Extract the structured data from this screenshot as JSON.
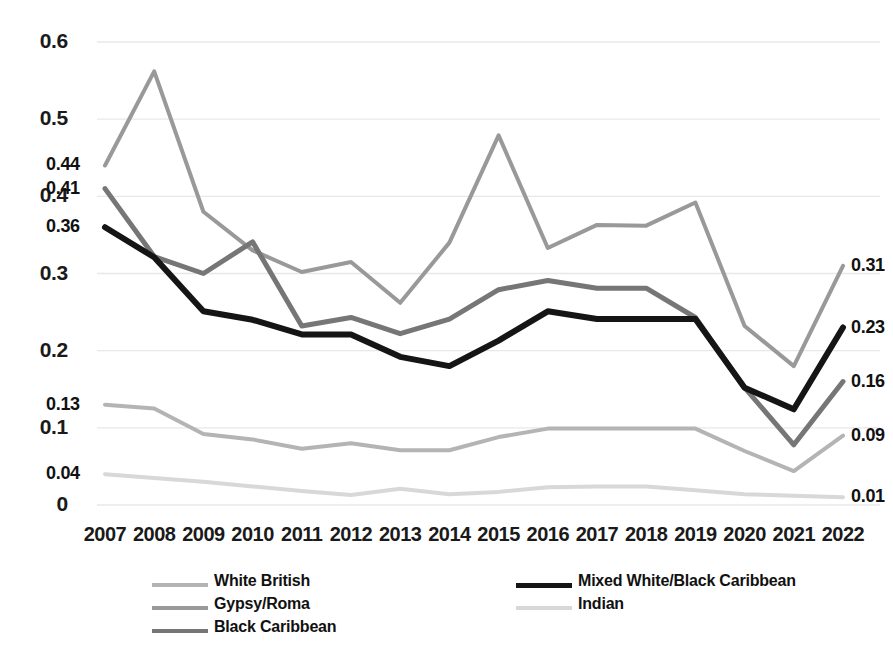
{
  "chart_data": {
    "type": "line",
    "title": "",
    "xlabel": "",
    "ylabel": "",
    "categories": [
      "2007",
      "2008",
      "2009",
      "2010",
      "2011",
      "2012",
      "2013",
      "2014",
      "2015",
      "2016",
      "2017",
      "2018",
      "2019",
      "2020",
      "2021",
      "2022"
    ],
    "ylim": [
      0,
      0.6
    ],
    "yticks": [
      "0",
      "0.1",
      "0.2",
      "0.3",
      "0.4",
      "0.5",
      "0.6"
    ],
    "ytick_values": [
      0,
      0.1,
      0.2,
      0.3,
      0.4,
      0.5,
      0.6
    ],
    "grid": true,
    "legend_position": "bottom",
    "series": [
      {
        "name": "White British",
        "color": "#b4b4b4",
        "width": 4,
        "values": [
          0.13,
          0.125,
          0.092,
          0.085,
          0.073,
          0.08,
          0.071,
          0.071,
          0.088,
          0.099,
          0.099,
          0.099,
          0.099,
          0.07,
          0.044,
          0.09
        ],
        "start_label": "0.13",
        "end_label": "0.09"
      },
      {
        "name": "Gypsy/Roma",
        "color": "#999999",
        "width": 4,
        "values": [
          0.44,
          0.562,
          0.38,
          0.33,
          0.302,
          0.315,
          0.262,
          0.34,
          0.479,
          0.333,
          0.363,
          0.362,
          0.392,
          0.232,
          0.18,
          0.31
        ],
        "start_label": "0.44",
        "end_label": "0.31"
      },
      {
        "name": "Black Caribbean",
        "color": "#767676",
        "width": 5,
        "values": [
          0.41,
          0.322,
          0.3,
          0.341,
          0.232,
          0.243,
          0.222,
          0.241,
          0.279,
          0.291,
          0.281,
          0.281,
          0.243,
          0.152,
          0.078,
          0.16
        ],
        "start_label": "0.41",
        "end_label": "0.16"
      },
      {
        "name": "Mixed White/Black Caribbean",
        "color": "#151515",
        "width": 6,
        "values": [
          0.36,
          0.321,
          0.251,
          0.24,
          0.221,
          0.221,
          0.192,
          0.18,
          0.213,
          0.251,
          0.241,
          0.241,
          0.241,
          0.152,
          0.124,
          0.23
        ],
        "start_label": "0.36",
        "end_label": "0.23"
      },
      {
        "name": "Indian",
        "color": "#d8d8d8",
        "width": 4,
        "values": [
          0.04,
          0.035,
          0.03,
          0.024,
          0.018,
          0.013,
          0.021,
          0.014,
          0.017,
          0.023,
          0.024,
          0.024,
          0.019,
          0.014,
          0.012,
          0.01
        ],
        "start_label": "0.04",
        "end_label": "0.01"
      }
    ]
  },
  "legend": {
    "column_left": [
      {
        "label": "White British",
        "series": 0
      },
      {
        "label": "Gypsy/Roma",
        "series": 1
      },
      {
        "label": "Black Caribbean",
        "series": 2
      }
    ],
    "column_right": [
      {
        "label": "Mixed White/Black Caribbean",
        "series": 3
      },
      {
        "label": "Indian",
        "series": 4
      }
    ]
  },
  "axis": {
    "grid_color": "#e8e8ec",
    "text_color": "#1a1a1a"
  }
}
